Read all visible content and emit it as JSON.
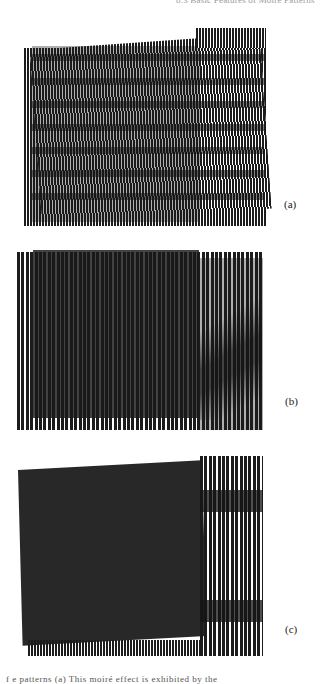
{
  "page": {
    "running_head": "8.3 Basic Features of Moiré Patterns",
    "bottom_text": "f        e patterns    (a) This moiré effect is exhibited by the"
  },
  "figures": [
    {
      "id": "a",
      "label": "(a)",
      "description": "Line grating with superposed slightly rotated grating producing horizontal moiré fringes"
    },
    {
      "id": "b",
      "label": "(b)",
      "description": "Line grating superposition with slight period difference producing diagonal moiré fringes"
    },
    {
      "id": "c",
      "label": "(c)",
      "description": "Line grating superposition with rotation producing broad horizontal fringes on the right"
    }
  ],
  "colors": {
    "ink": "#1c1c1c",
    "paper": "#ffffff"
  }
}
